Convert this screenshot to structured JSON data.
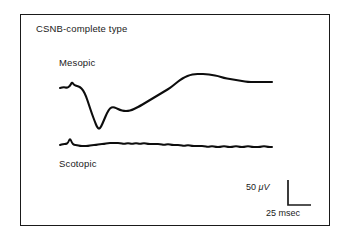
{
  "figure": {
    "title": "CSNB-complete type",
    "frame_color": "#1a1a1a",
    "background": "#ffffff",
    "trace_color": "#0d0d0d"
  },
  "traces": [
    {
      "name": "mesopic",
      "label": "Mesopic",
      "description": "Electroretinogram with small initial a-wave spike, deep negative trough, partial recovery notch, then slow broad positive b-wave peak followed by gradual decline to plateau"
    },
    {
      "name": "scotopic",
      "label": "Scotopic",
      "description": "Essentially flat, non-recordable electroretinogram with one small early spike and low-amplitude noise"
    }
  ],
  "scalebar": {
    "vertical_value": "50",
    "vertical_unit": "μV",
    "vertical_label": "50 μV",
    "horizontal_value": "25",
    "horizontal_unit": "msec",
    "horizontal_label": "25 msec"
  },
  "chart_data": {
    "type": "line",
    "title": "CSNB-complete type",
    "xlabel": "",
    "ylabel": "",
    "grid": false,
    "legend_position": "inline-labels",
    "axis_note": "No numeric axes drawn; calibration given by L-shaped scale bar",
    "scale_bar": {
      "amplitude": 50,
      "amplitude_unit": "μV",
      "time": 25,
      "time_unit": "msec"
    },
    "series": [
      {
        "name": "Mesopic",
        "units": "μV vs msec",
        "points_px": [
          [
            60,
            88
          ],
          [
            64,
            87
          ],
          [
            67,
            88
          ],
          [
            70,
            86
          ],
          [
            72,
            82
          ],
          [
            74,
            85
          ],
          [
            77,
            86
          ],
          [
            80,
            87
          ],
          [
            83,
            90
          ],
          [
            86,
            96
          ],
          [
            89,
            105
          ],
          [
            92,
            114
          ],
          [
            95,
            122
          ],
          [
            97,
            127
          ],
          [
            99,
            129
          ],
          [
            101,
            127
          ],
          [
            104,
            120
          ],
          [
            107,
            113
          ],
          [
            110,
            108
          ],
          [
            113,
            107
          ],
          [
            116,
            108
          ],
          [
            120,
            110
          ],
          [
            124,
            111
          ],
          [
            128,
            111
          ],
          [
            132,
            110
          ],
          [
            136,
            108
          ],
          [
            140,
            106
          ],
          [
            145,
            103
          ],
          [
            150,
            100
          ],
          [
            155,
            97
          ],
          [
            160,
            94
          ],
          [
            165,
            91
          ],
          [
            170,
            88
          ],
          [
            175,
            84
          ],
          [
            180,
            80
          ],
          [
            185,
            77
          ],
          [
            190,
            75
          ],
          [
            195,
            74
          ],
          [
            200,
            74
          ],
          [
            206,
            74
          ],
          [
            212,
            75
          ],
          [
            218,
            76
          ],
          [
            224,
            78
          ],
          [
            230,
            79
          ],
          [
            236,
            80
          ],
          [
            242,
            81
          ],
          [
            248,
            82
          ],
          [
            254,
            82
          ],
          [
            260,
            82
          ],
          [
            266,
            82
          ],
          [
            272,
            82
          ]
        ]
      },
      {
        "name": "Scotopic",
        "units": "μV vs msec",
        "points_px": [
          [
            60,
            145
          ],
          [
            63,
            144
          ],
          [
            66,
            144
          ],
          [
            68,
            143
          ],
          [
            70,
            138
          ],
          [
            72,
            143
          ],
          [
            74,
            145
          ],
          [
            77,
            145
          ],
          [
            80,
            146
          ],
          [
            84,
            146
          ],
          [
            88,
            146
          ],
          [
            92,
            145
          ],
          [
            96,
            145
          ],
          [
            100,
            144
          ],
          [
            104,
            144
          ],
          [
            108,
            143
          ],
          [
            112,
            143
          ],
          [
            116,
            143
          ],
          [
            120,
            143
          ],
          [
            124,
            144
          ],
          [
            128,
            143
          ],
          [
            132,
            144
          ],
          [
            136,
            143
          ],
          [
            140,
            144
          ],
          [
            144,
            143
          ],
          [
            148,
            144
          ],
          [
            152,
            144
          ],
          [
            156,
            144
          ],
          [
            160,
            144
          ],
          [
            164,
            145
          ],
          [
            168,
            144
          ],
          [
            172,
            145
          ],
          [
            176,
            145
          ],
          [
            180,
            145
          ],
          [
            184,
            146
          ],
          [
            188,
            145
          ],
          [
            192,
            146
          ],
          [
            196,
            146
          ],
          [
            200,
            146
          ],
          [
            204,
            146
          ],
          [
            208,
            147
          ],
          [
            212,
            146
          ],
          [
            216,
            147
          ],
          [
            220,
            147
          ],
          [
            224,
            146
          ],
          [
            228,
            147
          ],
          [
            232,
            147
          ],
          [
            236,
            146
          ],
          [
            240,
            147
          ],
          [
            244,
            147
          ],
          [
            248,
            146
          ],
          [
            252,
            147
          ],
          [
            256,
            147
          ],
          [
            260,
            147
          ],
          [
            264,
            146
          ],
          [
            268,
            147
          ],
          [
            272,
            147
          ]
        ]
      }
    ]
  }
}
